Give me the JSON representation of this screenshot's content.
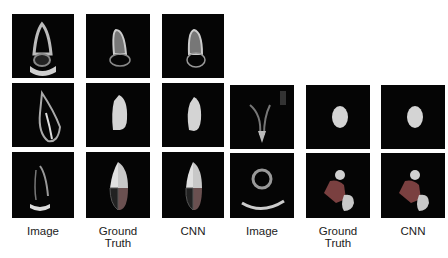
{
  "figure": {
    "columns": [
      {
        "label": "Image"
      },
      {
        "label": "Ground Truth",
        "line1": "Ground",
        "line2": "Truth"
      },
      {
        "label": "CNN"
      },
      {
        "label": "Image"
      },
      {
        "label": "Ground Truth",
        "line1": "Ground",
        "line2": "Truth"
      },
      {
        "label": "CNN"
      }
    ],
    "left_panel": {
      "rows": 3,
      "description": "Apical view echocardiograms with LV / multi-chamber segmentations"
    },
    "right_panel": {
      "rows": 2,
      "description": "Short axis / parasternal echocardiograms with segmentations"
    },
    "colors": {
      "background": "#ffffff",
      "tile": "#050505",
      "mask_light": "#c8c8c8",
      "mask_dark": "#5a5a5a",
      "mask_mid": "#8a8a8a"
    }
  }
}
